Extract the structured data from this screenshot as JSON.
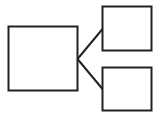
{
  "diagram": {
    "type": "tree",
    "stroke_color": "#222222",
    "background": "#ffffff",
    "nodes": [
      {
        "id": "root",
        "label": ""
      },
      {
        "id": "child-top",
        "label": ""
      },
      {
        "id": "child-bottom",
        "label": ""
      }
    ],
    "edges": [
      {
        "from": "root",
        "to": "child-top"
      },
      {
        "from": "root",
        "to": "child-bottom"
      }
    ]
  }
}
